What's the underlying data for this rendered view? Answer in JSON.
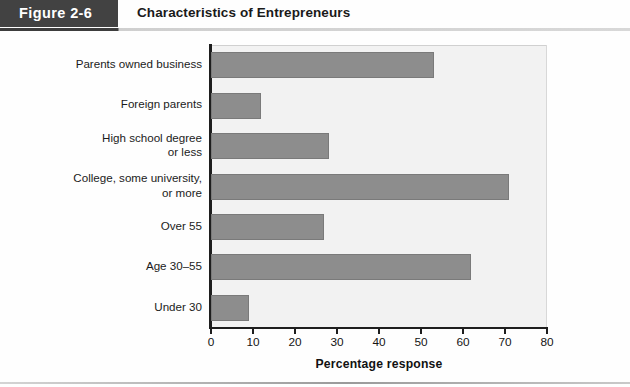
{
  "header": {
    "figure_tab": "Figure 2-6",
    "title": "Characteristics of Entrepreneurs"
  },
  "chart_data": {
    "type": "bar",
    "orientation": "horizontal",
    "title": "Characteristics of Entrepreneurs",
    "xlabel": "Percentage response",
    "ylabel": "",
    "xlim": [
      0,
      80
    ],
    "xticks": [
      0,
      10,
      20,
      30,
      40,
      50,
      60,
      70,
      80
    ],
    "grid": false,
    "legend": null,
    "bar_color": "#8d8d8d",
    "plot_background": "#f2f2f2",
    "categories": [
      "Parents owned business",
      "Foreign parents",
      "High school degree\nor less",
      "College, some university,\nor more",
      "Over 55",
      "Age 30–55",
      "Under 30"
    ],
    "values": [
      53,
      12,
      28,
      71,
      27,
      62,
      9
    ]
  }
}
